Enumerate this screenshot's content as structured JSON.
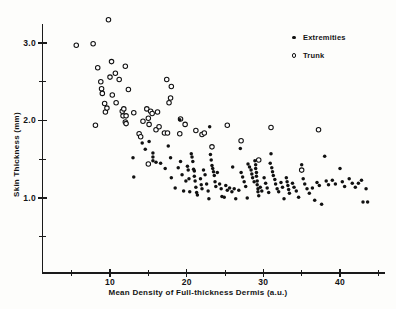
{
  "chart_data": {
    "type": "scatter",
    "title": "",
    "xlabel": "Mean Density of Full-thickness Dermis (a.u.)",
    "ylabel": "Skin Thickness (mm)",
    "xlim": [
      2,
      46
    ],
    "ylim": [
      0.35,
      3.35
    ],
    "grid": false,
    "legend_position": "top-right",
    "xticks": [
      10,
      20,
      30,
      40
    ],
    "xticklabels": [
      "10",
      "20",
      "30",
      "40"
    ],
    "xminorticks": [
      5,
      15,
      25,
      35,
      45
    ],
    "yticks": [
      1.0,
      2.0,
      3.0
    ],
    "yticklabels": [
      "1.0",
      "2.0",
      "3.0"
    ],
    "yminorticks": [
      0.5,
      1.5,
      2.5
    ],
    "series": [
      {
        "name": "Extremities",
        "marker": "filled-circle",
        "color": "#111111",
        "points": [
          [
            13.1,
            1.27
          ],
          [
            13.0,
            1.52
          ],
          [
            14.2,
            1.71
          ],
          [
            14.6,
            1.63
          ],
          [
            15.1,
            1.73
          ],
          [
            15.6,
            1.58
          ],
          [
            15.6,
            1.53
          ],
          [
            15.6,
            1.48
          ],
          [
            16.0,
            1.46
          ],
          [
            16.6,
            1.45
          ],
          [
            17.2,
            1.38
          ],
          [
            17.6,
            1.67
          ],
          [
            17.9,
            1.52
          ],
          [
            18.0,
            1.26
          ],
          [
            18.5,
            1.13
          ],
          [
            18.9,
            1.39
          ],
          [
            19.1,
            2.01
          ],
          [
            19.2,
            1.47
          ],
          [
            19.4,
            1.3
          ],
          [
            19.9,
            1.22
          ],
          [
            20.1,
            1.41
          ],
          [
            20.2,
            1.36
          ],
          [
            20.3,
            1.25
          ],
          [
            20.6,
            1.57
          ],
          [
            20.7,
            1.53
          ],
          [
            20.8,
            1.47
          ],
          [
            20.9,
            1.37
          ],
          [
            21.0,
            1.35
          ],
          [
            21.0,
            1.28
          ],
          [
            21.1,
            1.22
          ],
          [
            21.2,
            1.14
          ],
          [
            21.3,
            1.07
          ],
          [
            21.4,
            1.04
          ],
          [
            21.8,
            1.25
          ],
          [
            21.9,
            1.17
          ],
          [
            22.0,
            1.12
          ],
          [
            22.2,
            1.36
          ],
          [
            22.4,
            1.3
          ],
          [
            22.6,
            1.18
          ],
          [
            22.8,
            1.09
          ],
          [
            23.0,
            1.92
          ],
          [
            23.1,
            1.56
          ],
          [
            23.2,
            1.49
          ],
          [
            23.3,
            1.42
          ],
          [
            23.4,
            1.38
          ],
          [
            23.5,
            1.34
          ],
          [
            23.6,
            1.29
          ],
          [
            23.7,
            1.21
          ],
          [
            23.8,
            1.15
          ],
          [
            24.0,
            1.33
          ],
          [
            24.3,
            1.18
          ],
          [
            24.5,
            1.12
          ],
          [
            24.6,
            1.02
          ],
          [
            25.1,
            1.16
          ],
          [
            25.3,
            1.1
          ],
          [
            25.6,
            1.13
          ],
          [
            25.9,
            1.08
          ],
          [
            26.2,
            1.12
          ],
          [
            26.4,
            0.99
          ],
          [
            26.8,
            1.1
          ],
          [
            27.0,
            1.64
          ],
          [
            27.1,
            1.33
          ],
          [
            27.3,
            1.27
          ],
          [
            27.5,
            1.21
          ],
          [
            27.7,
            1.15
          ],
          [
            27.9,
            1.0
          ],
          [
            28.0,
            1.44
          ],
          [
            28.2,
            1.4
          ],
          [
            28.4,
            1.36
          ],
          [
            28.5,
            1.31
          ],
          [
            28.6,
            1.26
          ],
          [
            28.8,
            1.21
          ],
          [
            28.9,
            1.48
          ],
          [
            29.0,
            1.43
          ],
          [
            29.0,
            1.38
          ],
          [
            29.1,
            1.33
          ],
          [
            29.1,
            1.28
          ],
          [
            29.2,
            1.22
          ],
          [
            29.2,
            1.17
          ],
          [
            29.3,
            1.12
          ],
          [
            29.3,
            1.08
          ],
          [
            29.4,
            1.03
          ],
          [
            29.6,
            1.14
          ],
          [
            29.8,
            1.09
          ],
          [
            30.1,
            1.26
          ],
          [
            30.3,
            1.19
          ],
          [
            30.5,
            1.13
          ],
          [
            30.7,
            1.07
          ],
          [
            31.0,
            1.57
          ],
          [
            31.1,
            1.39
          ],
          [
            31.2,
            1.34
          ],
          [
            31.3,
            1.29
          ],
          [
            31.5,
            1.24
          ],
          [
            31.6,
            1.18
          ],
          [
            31.8,
            1.12
          ],
          [
            32.0,
            1.08
          ],
          [
            32.3,
            1.2
          ],
          [
            32.5,
            1.14
          ],
          [
            32.7,
            0.99
          ],
          [
            33.0,
            1.26
          ],
          [
            33.1,
            1.21
          ],
          [
            33.2,
            1.16
          ],
          [
            33.3,
            1.11
          ],
          [
            33.4,
            1.06
          ],
          [
            33.8,
            1.19
          ],
          [
            34.0,
            1.14
          ],
          [
            34.3,
            1.09
          ],
          [
            34.6,
            1.01
          ],
          [
            35.0,
            1.43
          ],
          [
            35.2,
            1.25
          ],
          [
            35.4,
            1.18
          ],
          [
            35.7,
            1.12
          ],
          [
            36.0,
            1.06
          ],
          [
            36.4,
            1.13
          ],
          [
            36.7,
            0.97
          ],
          [
            37.0,
            1.2
          ],
          [
            37.3,
            1.16
          ],
          [
            37.6,
            0.92
          ],
          [
            38.0,
            1.54
          ],
          [
            38.2,
            1.22
          ],
          [
            38.5,
            1.17
          ],
          [
            39.0,
            1.23
          ],
          [
            39.4,
            1.18
          ],
          [
            40.0,
            1.38
          ],
          [
            40.3,
            1.21
          ],
          [
            40.6,
            1.15
          ],
          [
            41.2,
            1.25
          ],
          [
            41.6,
            1.19
          ],
          [
            42.0,
            1.14
          ],
          [
            42.4,
            1.19
          ],
          [
            42.8,
            1.23
          ],
          [
            43.0,
            0.95
          ],
          [
            43.6,
            0.95
          ],
          [
            43.4,
            1.12
          ],
          [
            30.9,
            1.45
          ],
          [
            26.0,
            1.4
          ],
          [
            24.9,
            1.01
          ],
          [
            22.9,
            0.99
          ],
          [
            20.4,
            1.08
          ],
          [
            19.6,
            1.09
          ]
        ]
      },
      {
        "name": "Trunk",
        "marker": "open-circle",
        "color": "#111111",
        "points": [
          [
            5.6,
            2.97
          ],
          [
            7.8,
            2.99
          ],
          [
            9.8,
            3.3
          ],
          [
            8.4,
            2.68
          ],
          [
            10.2,
            2.76
          ],
          [
            10.7,
            2.61
          ],
          [
            11.2,
            2.53
          ],
          [
            12.0,
            2.7
          ],
          [
            8.8,
            2.5
          ],
          [
            8.9,
            2.41
          ],
          [
            9.0,
            2.35
          ],
          [
            10.0,
            2.56
          ],
          [
            9.3,
            2.22
          ],
          [
            10.3,
            2.33
          ],
          [
            10.8,
            2.23
          ],
          [
            12.4,
            2.4
          ],
          [
            8.1,
            1.94
          ],
          [
            9.4,
            2.11
          ],
          [
            9.6,
            2.16
          ],
          [
            11.6,
            2.12
          ],
          [
            11.7,
            2.06
          ],
          [
            11.8,
            2.15
          ],
          [
            12.0,
            1.98
          ],
          [
            12.1,
            1.96
          ],
          [
            13.1,
            2.1
          ],
          [
            14.8,
            2.15
          ],
          [
            15.3,
            2.12
          ],
          [
            15.5,
            2.09
          ],
          [
            16.2,
            2.11
          ],
          [
            14.3,
            1.99
          ],
          [
            15.0,
            2.03
          ],
          [
            15.1,
            1.95
          ],
          [
            13.8,
            1.83
          ],
          [
            14.0,
            1.79
          ],
          [
            16.0,
            1.88
          ],
          [
            16.4,
            1.92
          ],
          [
            17.1,
            1.84
          ],
          [
            17.5,
            1.84
          ],
          [
            17.4,
            2.53
          ],
          [
            18.0,
            2.44
          ],
          [
            17.9,
            2.29
          ],
          [
            17.7,
            2.23
          ],
          [
            19.2,
            2.02
          ],
          [
            19.1,
            1.83
          ],
          [
            19.8,
            1.95
          ],
          [
            21.2,
            1.87
          ],
          [
            22.0,
            1.82
          ],
          [
            22.3,
            1.84
          ],
          [
            25.3,
            1.94
          ],
          [
            23.3,
            1.66
          ],
          [
            27.1,
            1.74
          ],
          [
            31.0,
            1.91
          ],
          [
            37.2,
            1.88
          ],
          [
            35.0,
            1.36
          ],
          [
            29.4,
            1.49
          ],
          [
            15.0,
            1.44
          ],
          [
            12.1,
            2.06
          ]
        ]
      }
    ]
  },
  "legend": {
    "items": [
      {
        "label": "Extremities",
        "marker": "filled-circle"
      },
      {
        "label": "Trunk",
        "marker": "open-circle"
      }
    ]
  }
}
